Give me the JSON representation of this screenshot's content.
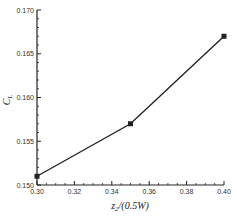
{
  "chart_data": {
    "type": "line",
    "title": "",
    "xlabel": "z2/(0.5W)",
    "ylabel": "CL",
    "xlabel_parts": {
      "main": "z",
      "sub": "2",
      "rest": "/(0.5W)"
    },
    "ylabel_parts": {
      "main": "C",
      "sub": "L"
    },
    "x": [
      0.3,
      0.35,
      0.4
    ],
    "series": [
      {
        "name": "CL",
        "values": [
          0.151,
          0.157,
          0.167
        ],
        "marker": "square",
        "color": "#222222"
      }
    ],
    "xlim": [
      0.3,
      0.4
    ],
    "ylim": [
      0.15,
      0.17
    ],
    "x_ticks": [
      "0.30",
      "0.32",
      "0.34",
      "0.36",
      "0.38",
      "0.40"
    ],
    "y_ticks": [
      "0.150",
      "0.155",
      "0.160",
      "0.165",
      "0.170"
    ],
    "grid": false,
    "legend": null
  }
}
